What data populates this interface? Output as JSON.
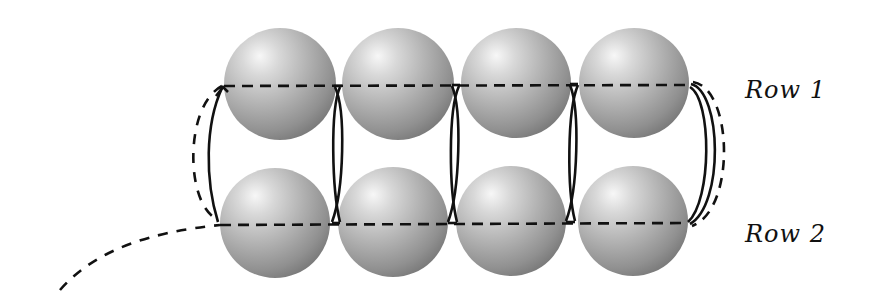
{
  "diagram": {
    "colors": {
      "bead_highlight": "#f4f4f4",
      "bead_mid": "#b5b5b5",
      "bead_shadow": "#7e7e7e",
      "thread": "#111111",
      "background": "#ffffff"
    },
    "rows": [
      {
        "label": "Row 1",
        "beads": [
          {
            "cx": 280,
            "cy": 84,
            "r": 56
          },
          {
            "cx": 398,
            "cy": 84,
            "r": 56
          },
          {
            "cx": 516,
            "cy": 83,
            "r": 55
          },
          {
            "cx": 634,
            "cy": 83,
            "r": 55
          }
        ],
        "thread_y": 86
      },
      {
        "label": "Row 2",
        "beads": [
          {
            "cx": 275,
            "cy": 223,
            "r": 55
          },
          {
            "cx": 393,
            "cy": 222,
            "r": 55
          },
          {
            "cx": 511,
            "cy": 221,
            "r": 55
          },
          {
            "cx": 633,
            "cy": 221,
            "r": 55
          }
        ],
        "thread_y": 224
      }
    ],
    "labels": {
      "row1": "Row 1",
      "row2": "Row 2"
    },
    "thread_legend": {
      "dashed": "thread passing behind / through bead holes",
      "solid": "thread visible in front, connecting rows"
    }
  }
}
